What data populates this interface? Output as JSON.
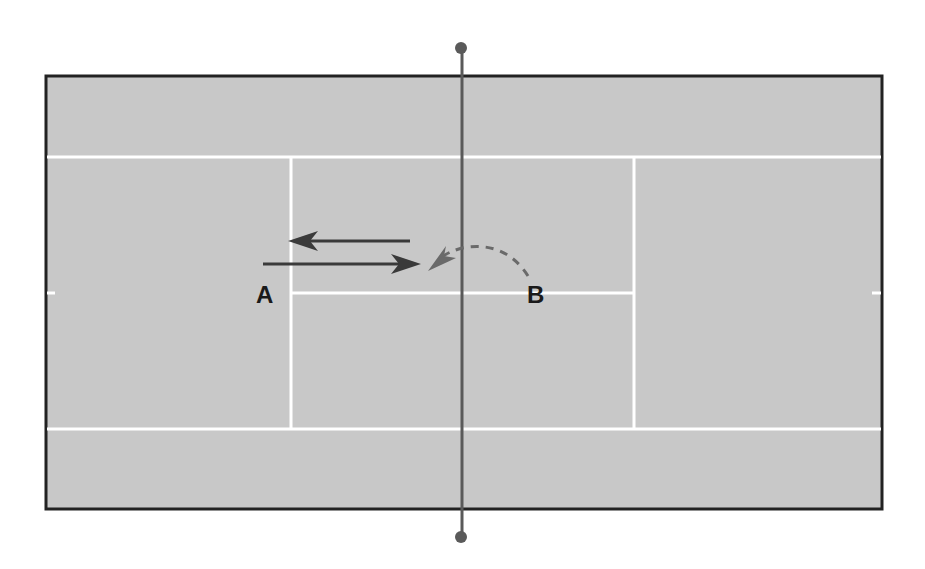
{
  "diagram": {
    "type": "tennis-court-top-view",
    "colors": {
      "background": "#ffffff",
      "court_surface": "#c8c8c8",
      "court_border": "#222222",
      "court_lines": "#ffffff",
      "net": "#5a5a5a",
      "arrow_solid": "#3a3a3a",
      "arrow_dashed": "#6a6a6a",
      "label": "#1a1a1a"
    },
    "players": [
      {
        "id": "A",
        "label": "A"
      },
      {
        "id": "B",
        "label": "B"
      }
    ],
    "arrows": [
      {
        "name": "return-arrow",
        "style": "solid",
        "direction": "toward A"
      },
      {
        "name": "shot-arrow",
        "style": "solid",
        "direction": "toward net from A"
      },
      {
        "name": "lob-arc-arrow",
        "style": "dashed",
        "direction": "from B over net"
      }
    ]
  }
}
